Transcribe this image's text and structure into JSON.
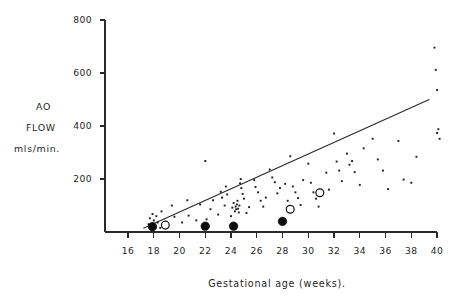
{
  "chart_data": {
    "type": "scatter",
    "title": "",
    "xlabel": "Gestational age (weeks).",
    "ylabel_lines": [
      "AO",
      "FLOW",
      "mls/min."
    ],
    "ylabel": "AO FLOW mls/min.",
    "xlim": [
      15,
      41
    ],
    "ylim": [
      0,
      800
    ],
    "xticks": [
      16,
      18,
      20,
      22,
      24,
      26,
      28,
      30,
      32,
      34,
      36,
      38,
      40
    ],
    "yticks": [
      200,
      400,
      600,
      800
    ],
    "xtick_labels": [
      "16",
      "18",
      "20",
      "22",
      "24",
      "26",
      "28",
      "30",
      "32",
      "34",
      "36",
      "38",
      "40"
    ],
    "ytick_labels": [
      "200",
      "400",
      "600",
      "800"
    ],
    "grid": false,
    "legend": "none",
    "series": [
      {
        "name": "scatter-small-dots",
        "marker": "small-dot",
        "points": [
          [
            17.6,
            30
          ],
          [
            17.7,
            52
          ],
          [
            17.8,
            18
          ],
          [
            17.9,
            68
          ],
          [
            18.0,
            44
          ],
          [
            18.1,
            22
          ],
          [
            18.2,
            60
          ],
          [
            18.3,
            36
          ],
          [
            18.5,
            16
          ],
          [
            18.6,
            78
          ],
          [
            19.4,
            100
          ],
          [
            19.6,
            58
          ],
          [
            20.2,
            36
          ],
          [
            20.6,
            120
          ],
          [
            20.7,
            62
          ],
          [
            21.3,
            44
          ],
          [
            21.6,
            104
          ],
          [
            22.0,
            268
          ],
          [
            22.1,
            48
          ],
          [
            22.4,
            86
          ],
          [
            22.6,
            120
          ],
          [
            23.0,
            66
          ],
          [
            23.2,
            152
          ],
          [
            23.3,
            130
          ],
          [
            23.5,
            100
          ],
          [
            23.6,
            172
          ],
          [
            23.7,
            142
          ],
          [
            24.0,
            60
          ],
          [
            24.1,
            92
          ],
          [
            24.2,
            110
          ],
          [
            24.3,
            78
          ],
          [
            24.35,
            96
          ],
          [
            24.4,
            86
          ],
          [
            24.45,
            104
          ],
          [
            24.5,
            118
          ],
          [
            24.55,
            88
          ],
          [
            24.6,
            74
          ],
          [
            24.65,
            100
          ],
          [
            24.7,
            184
          ],
          [
            24.75,
            200
          ],
          [
            24.8,
            166
          ],
          [
            24.9,
            144
          ],
          [
            25.0,
            126
          ],
          [
            25.2,
            72
          ],
          [
            25.4,
            94
          ],
          [
            25.8,
            196
          ],
          [
            25.9,
            170
          ],
          [
            26.1,
            150
          ],
          [
            26.3,
            118
          ],
          [
            26.5,
            96
          ],
          [
            26.7,
            130
          ],
          [
            27.0,
            236
          ],
          [
            27.2,
            206
          ],
          [
            27.4,
            188
          ],
          [
            27.6,
            146
          ],
          [
            27.8,
            166
          ],
          [
            28.2,
            182
          ],
          [
            28.4,
            118
          ],
          [
            28.6,
            286
          ],
          [
            28.8,
            172
          ],
          [
            29.0,
            150
          ],
          [
            29.2,
            128
          ],
          [
            29.4,
            102
          ],
          [
            29.6,
            196
          ],
          [
            30.0,
            258
          ],
          [
            30.2,
            186
          ],
          [
            30.4,
            150
          ],
          [
            30.6,
            126
          ],
          [
            30.8,
            96
          ],
          [
            31.0,
            138
          ],
          [
            31.4,
            224
          ],
          [
            31.6,
            160
          ],
          [
            32.0,
            372
          ],
          [
            32.2,
            266
          ],
          [
            32.4,
            232
          ],
          [
            32.6,
            192
          ],
          [
            33.0,
            296
          ],
          [
            33.2,
            254
          ],
          [
            33.4,
            268
          ],
          [
            33.6,
            226
          ],
          [
            34.0,
            178
          ],
          [
            34.3,
            316
          ],
          [
            35.0,
            352
          ],
          [
            35.4,
            274
          ],
          [
            35.8,
            232
          ],
          [
            36.2,
            162
          ],
          [
            37.0,
            344
          ],
          [
            37.4,
            198
          ],
          [
            38.0,
            186
          ],
          [
            38.4,
            284
          ],
          [
            39.8,
            696
          ],
          [
            39.9,
            612
          ],
          [
            40.0,
            536
          ],
          [
            40.1,
            388
          ],
          [
            40.2,
            352
          ],
          [
            40.0,
            374
          ]
        ]
      },
      {
        "name": "highlighted-filled-circles",
        "marker": "large-filled-circle",
        "points": [
          [
            17.9,
            20
          ],
          [
            22.0,
            22
          ],
          [
            24.2,
            22
          ],
          [
            28.0,
            40
          ]
        ]
      },
      {
        "name": "highlighted-open-circles",
        "marker": "large-open-circle",
        "points": [
          [
            18.9,
            26
          ],
          [
            28.6,
            86
          ],
          [
            30.9,
            148
          ]
        ]
      }
    ],
    "trendline": {
      "name": "regression-line",
      "x0": 17.2,
      "y0": 14,
      "x1": 39.4,
      "y1": 500
    }
  },
  "colors": {
    "background": "#ffffff",
    "axis": "#2b2b2b",
    "point": "#1c1c1c",
    "line": "#262626"
  }
}
